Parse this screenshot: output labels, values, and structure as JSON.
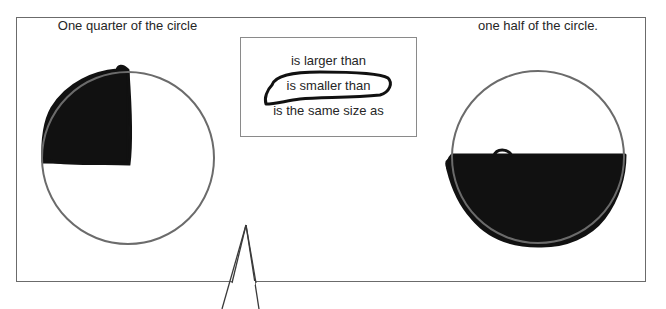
{
  "diagram": {
    "left_panel": {
      "label": "One quarter of the circle",
      "shaded_fraction": "1/4",
      "shaded_region": "top-left quarter"
    },
    "comparison": {
      "options": [
        {
          "label": "is larger than",
          "selected": false
        },
        {
          "label": "is smaller than",
          "selected": true
        },
        {
          "label": "is the same size as",
          "selected": false
        }
      ]
    },
    "right_panel": {
      "label": "one half of the circle.",
      "shaded_fraction": "1/2",
      "shaded_region": "bottom half"
    }
  },
  "colors": {
    "circle_outline": "#6b6b6b",
    "scribble_fill": "#111111",
    "frame_border": "#6b6b6b",
    "text": "#262626"
  }
}
